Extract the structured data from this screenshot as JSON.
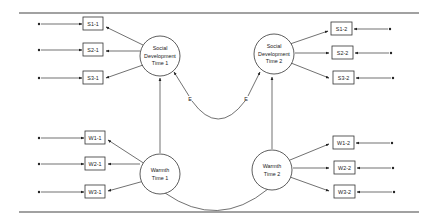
{
  "diagram": {
    "type": "structural-equation-model",
    "latent_factors": [
      {
        "id": "sd1",
        "lines": [
          "Social",
          "Development",
          "Time 1"
        ]
      },
      {
        "id": "sd2",
        "lines": [
          "Social",
          "Development",
          "Time 2"
        ]
      },
      {
        "id": "w1",
        "lines": [
          "Warmth",
          "Time 1"
        ]
      },
      {
        "id": "w2",
        "lines": [
          "Warmth",
          "Time 2"
        ]
      }
    ],
    "indicators_left": [
      {
        "label": "S1-1",
        "factor": "sd1"
      },
      {
        "label": "S2-1",
        "factor": "sd1"
      },
      {
        "label": "S3-1",
        "factor": "sd1"
      },
      {
        "label": "W1-1",
        "factor": "w1"
      },
      {
        "label": "W2-1",
        "factor": "w1"
      },
      {
        "label": "W3-1",
        "factor": "w1"
      }
    ],
    "indicators_right": [
      {
        "label": "S1-2",
        "factor": "sd2"
      },
      {
        "label": "S2-2",
        "factor": "sd2"
      },
      {
        "label": "S3-2",
        "factor": "sd2"
      },
      {
        "label": "W1-2",
        "factor": "w2"
      },
      {
        "label": "W2-2",
        "factor": "w2"
      },
      {
        "label": "W3-2",
        "factor": "w2"
      }
    ],
    "error_labels": [
      "E",
      "E"
    ],
    "paths": [
      {
        "from": "w1",
        "to": "sd1",
        "type": "regression"
      },
      {
        "from": "w2",
        "to": "sd2",
        "type": "regression"
      },
      {
        "from": "sd1",
        "to": "sd2",
        "type": "correlated-errors",
        "label": "E"
      },
      {
        "from": "w1",
        "to": "w2",
        "type": "covariance"
      }
    ],
    "colors": {
      "line": "#333333",
      "background": "#ffffff"
    }
  }
}
